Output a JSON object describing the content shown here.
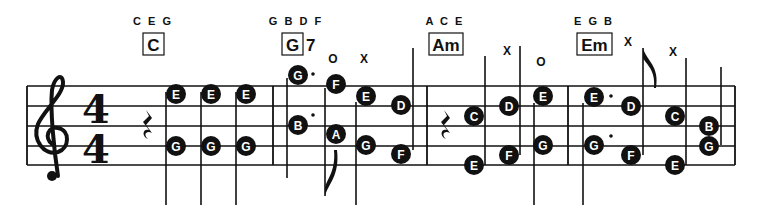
{
  "staff": {
    "clef": "treble",
    "time_signature": {
      "top": "4",
      "bottom": "4"
    },
    "lines_y": [
      86,
      106,
      126,
      146,
      165
    ],
    "left": 27,
    "right": 735,
    "barlines_x": [
      273,
      427,
      568,
      735
    ]
  },
  "chords": [
    {
      "name": "C",
      "suffix": "",
      "tones": "C E G",
      "box_x": 143
    },
    {
      "name": "G",
      "suffix": "7",
      "tones": "G B D F",
      "box_x": 282
    },
    {
      "name": "Am",
      "suffix": "",
      "tones": "A C E",
      "box_x": 429
    },
    {
      "name": "Em",
      "suffix": "",
      "tones": "E G B",
      "box_x": 577
    }
  ],
  "marks": [
    {
      "text": "O",
      "x": 333,
      "y": 63
    },
    {
      "text": "X",
      "x": 364,
      "y": 63
    },
    {
      "text": "X",
      "x": 507,
      "y": 55
    },
    {
      "text": "O",
      "x": 541,
      "y": 66
    },
    {
      "text": "X",
      "x": 628,
      "y": 46
    },
    {
      "text": "X",
      "x": 673,
      "y": 56
    }
  ],
  "notes": [
    {
      "letter": "E",
      "x": 176,
      "y": 94
    },
    {
      "letter": "G",
      "x": 176,
      "y": 146
    },
    {
      "letter": "E",
      "x": 211,
      "y": 94
    },
    {
      "letter": "G",
      "x": 211,
      "y": 146
    },
    {
      "letter": "E",
      "x": 246,
      "y": 94
    },
    {
      "letter": "G",
      "x": 246,
      "y": 146
    },
    {
      "letter": "G",
      "x": 298,
      "y": 75
    },
    {
      "letter": "B",
      "x": 298,
      "y": 125
    },
    {
      "letter": "F",
      "x": 336,
      "y": 84
    },
    {
      "letter": "A",
      "x": 336,
      "y": 134
    },
    {
      "letter": "E",
      "x": 366,
      "y": 96
    },
    {
      "letter": "G",
      "x": 366,
      "y": 145
    },
    {
      "letter": "D",
      "x": 401,
      "y": 105
    },
    {
      "letter": "F",
      "x": 401,
      "y": 154
    },
    {
      "letter": "C",
      "x": 474,
      "y": 116
    },
    {
      "letter": "E",
      "x": 474,
      "y": 165
    },
    {
      "letter": "D",
      "x": 509,
      "y": 106
    },
    {
      "letter": "F",
      "x": 509,
      "y": 155
    },
    {
      "letter": "E",
      "x": 543,
      "y": 96
    },
    {
      "letter": "G",
      "x": 543,
      "y": 145
    },
    {
      "letter": "E",
      "x": 594,
      "y": 97
    },
    {
      "letter": "G",
      "x": 594,
      "y": 145
    },
    {
      "letter": "D",
      "x": 631,
      "y": 106
    },
    {
      "letter": "F",
      "x": 631,
      "y": 155
    },
    {
      "letter": "C",
      "x": 675,
      "y": 116
    },
    {
      "letter": "E",
      "x": 675,
      "y": 165
    },
    {
      "letter": "B",
      "x": 709,
      "y": 126
    },
    {
      "letter": "G",
      "x": 709,
      "y": 146
    }
  ],
  "stems": [
    {
      "x": 166,
      "y1": 92,
      "y2": 205
    },
    {
      "x": 201,
      "y1": 92,
      "y2": 205
    },
    {
      "x": 236,
      "y1": 92,
      "y2": 205
    },
    {
      "x": 287,
      "y1": 78,
      "y2": 178
    },
    {
      "x": 325,
      "y1": 88,
      "y2": 196
    },
    {
      "x": 356,
      "y1": 102,
      "y2": 205
    },
    {
      "x": 413,
      "y1": 48,
      "y2": 150
    },
    {
      "x": 485,
      "y1": 56,
      "y2": 165
    },
    {
      "x": 520,
      "y1": 46,
      "y2": 155
    },
    {
      "x": 534,
      "y1": 103,
      "y2": 205
    },
    {
      "x": 583,
      "y1": 103,
      "y2": 205
    },
    {
      "x": 643,
      "y1": 48,
      "y2": 155
    },
    {
      "x": 686,
      "y1": 58,
      "y2": 165
    },
    {
      "x": 721,
      "y1": 67,
      "y2": 145
    }
  ],
  "rests": [
    {
      "x": 148,
      "y": 126
    },
    {
      "x": 446,
      "y": 126
    }
  ],
  "dots": [
    {
      "x": 313,
      "y": 74
    },
    {
      "x": 313,
      "y": 115
    },
    {
      "x": 611,
      "y": 96
    },
    {
      "x": 611,
      "y": 136
    }
  ]
}
